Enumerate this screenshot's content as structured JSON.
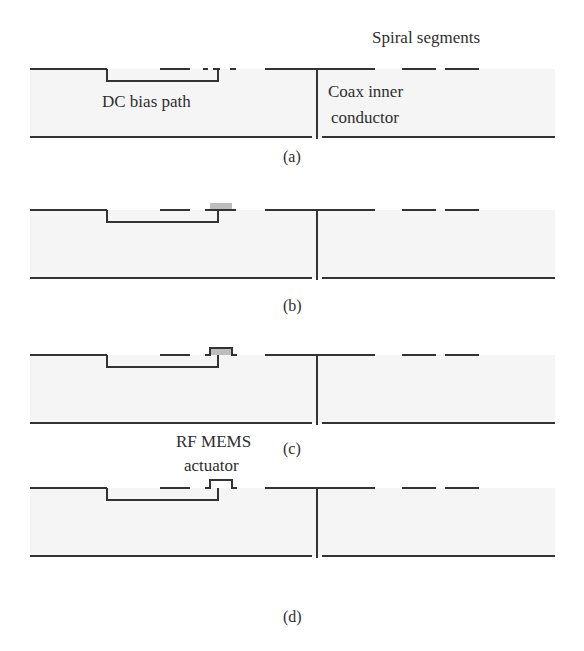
{
  "figure": {
    "labels": {
      "spiral_segments": "Spiral segments",
      "dc_bias_path": "DC bias path",
      "coax_line1": "Coax inner",
      "coax_line2": "conductor",
      "rf_mems_line1": "RF MEMS",
      "rf_mems_line2": "actuator"
    },
    "panels": [
      {
        "caption": "(a)",
        "top_y": 69,
        "bottom_y": 137,
        "actuator": "none"
      },
      {
        "caption": "(b)",
        "top_y": 210,
        "bottom_y": 279,
        "actuator": "gray-pad"
      },
      {
        "caption": "(c)",
        "top_y": 355,
        "bottom_y": 424,
        "actuator": "pad-with-bridge"
      },
      {
        "caption": "(d)",
        "top_y": 488,
        "bottom_y": 584,
        "actuator": "bridge-only"
      }
    ],
    "colors": {
      "line": "#333333",
      "substrate": "#f4f4f4",
      "actuator_pad": "#bdbdbd"
    }
  }
}
